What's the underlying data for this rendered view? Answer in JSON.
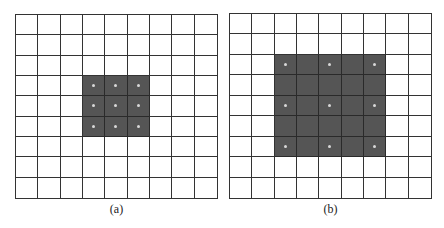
{
  "figure": {
    "panels": [
      {
        "id": "a",
        "caption": "(a)",
        "rows": 9,
        "cols": 9,
        "shaded_region": {
          "row_start": 3,
          "row_end": 5,
          "col_start": 3,
          "col_end": 5
        },
        "dots": [
          [
            3,
            3
          ],
          [
            3,
            4
          ],
          [
            3,
            5
          ],
          [
            4,
            3
          ],
          [
            4,
            4
          ],
          [
            4,
            5
          ],
          [
            5,
            3
          ],
          [
            5,
            4
          ],
          [
            5,
            5
          ]
        ],
        "box": {
          "x": 15,
          "y": 14,
          "w": 203,
          "h": 185
        }
      },
      {
        "id": "b",
        "caption": "(b)",
        "rows": 9,
        "cols": 9,
        "shaded_region": {
          "row_start": 2,
          "row_end": 6,
          "col_start": 2,
          "col_end": 6
        },
        "dots": [
          [
            2,
            2
          ],
          [
            2,
            4
          ],
          [
            2,
            6
          ],
          [
            4,
            2
          ],
          [
            4,
            4
          ],
          [
            4,
            6
          ],
          [
            6,
            2
          ],
          [
            6,
            4
          ],
          [
            6,
            6
          ]
        ],
        "box": {
          "x": 229,
          "y": 13,
          "w": 203,
          "h": 186
        }
      }
    ],
    "colors": {
      "grid_line": "#333333",
      "shaded": "#555555",
      "dot": "#d8d8d8"
    }
  }
}
